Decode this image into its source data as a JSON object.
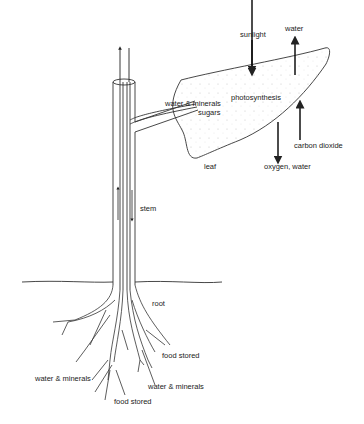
{
  "diagram": {
    "type": "plant transport diagram",
    "labels": {
      "sunlight": "sunlight",
      "water_top": "water",
      "photosynthesis": "photosynthesis",
      "water_minerals_leaf": "water & minerals",
      "sugars": "sugars",
      "carbon_dioxide": "carbon dioxide",
      "leaf": "leaf",
      "oxygen_water": "oxygen, water",
      "stem": "stem",
      "root": "root",
      "food_stored_right": "food stored",
      "water_minerals_left": "water & minerals",
      "water_minerals_right": "water & minerals",
      "food_stored_bottom": "food stored"
    },
    "colors": {
      "line": "#333333",
      "leaf_dots": "#bbbbbb",
      "background": "#ffffff"
    }
  }
}
